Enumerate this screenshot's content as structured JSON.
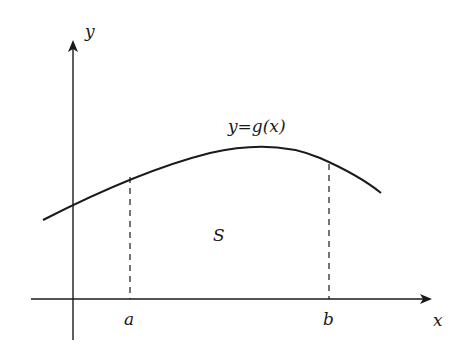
{
  "diagram": {
    "type": "area-under-curve",
    "axes": {
      "x_label": "x",
      "y_label": "y"
    },
    "curve": {
      "label": "y=g(x)",
      "points": [
        [
          43,
          220
        ],
        [
          73,
          204
        ],
        [
          130,
          177
        ],
        [
          200,
          155
        ],
        [
          265,
          147
        ],
        [
          300,
          152
        ],
        [
          329,
          164
        ],
        [
          360,
          178
        ],
        [
          381,
          193
        ]
      ]
    },
    "bounds": {
      "left_label": "a",
      "right_label": "b"
    },
    "region_label": "S",
    "colors": {
      "stroke": "#1a1a1a",
      "background": "#ffffff"
    }
  }
}
